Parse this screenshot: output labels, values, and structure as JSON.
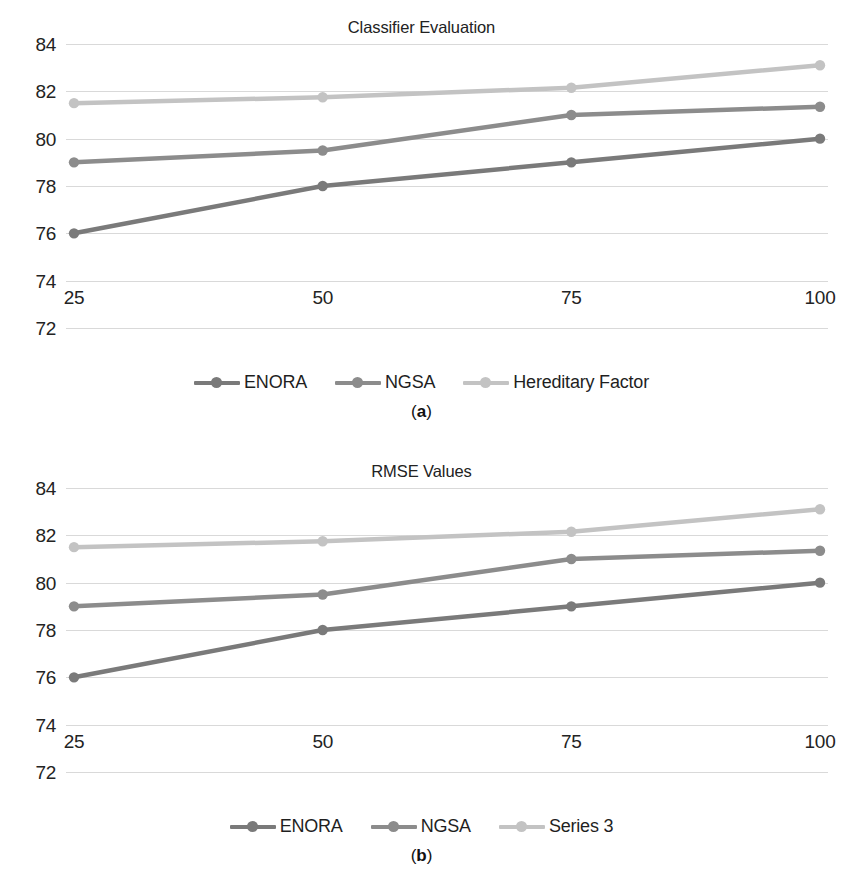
{
  "figure": {
    "panels": [
      {
        "key": "panel_a",
        "title": "Classifier Evaluation",
        "caption_open": "(",
        "caption_letter": "a",
        "caption_close": ")",
        "legend": [
          {
            "label": "ENORA",
            "color": "#7a7a7a"
          },
          {
            "label": "NGSA",
            "color": "#8c8c8c"
          },
          {
            "label": "Hereditary Factor",
            "color": "#c3c3c3"
          }
        ]
      },
      {
        "key": "panel_b",
        "title": "RMSE Values",
        "caption_open": "(",
        "caption_letter": "b",
        "caption_close": ")",
        "legend": [
          {
            "label": "ENORA",
            "color": "#7a7a7a"
          },
          {
            "label": "NGSA",
            "color": "#8c8c8c"
          },
          {
            "label": "Series 3",
            "color": "#c3c3c3"
          }
        ]
      }
    ]
  },
  "chart_data": [
    {
      "type": "line",
      "title": "Classifier Evaluation",
      "xlabel": "",
      "ylabel": "",
      "categories": [
        "25",
        "50",
        "75",
        "100"
      ],
      "x": [
        25,
        50,
        75,
        100
      ],
      "ylim": [
        72,
        84
      ],
      "yticks": [
        84,
        82,
        80,
        78,
        76,
        74,
        72
      ],
      "xticks": [
        "25",
        "50",
        "75",
        "100"
      ],
      "grid": true,
      "legend_position": "bottom",
      "markers": "circle",
      "series": [
        {
          "name": "ENORA",
          "color": "#7a7a7a",
          "values": [
            76.0,
            78.0,
            79.0,
            80.0
          ]
        },
        {
          "name": "NGSA",
          "color": "#8c8c8c",
          "values": [
            79.0,
            79.5,
            81.0,
            81.35
          ]
        },
        {
          "name": "Hereditary Factor",
          "color": "#c3c3c3",
          "values": [
            81.5,
            81.75,
            82.15,
            83.1
          ]
        }
      ]
    },
    {
      "type": "line",
      "title": "RMSE Values",
      "xlabel": "",
      "ylabel": "",
      "categories": [
        "25",
        "50",
        "75",
        "100"
      ],
      "x": [
        25,
        50,
        75,
        100
      ],
      "ylim": [
        72,
        84
      ],
      "yticks": [
        84,
        82,
        80,
        78,
        76,
        74,
        72
      ],
      "xticks": [
        "25",
        "50",
        "75",
        "100"
      ],
      "grid": true,
      "legend_position": "bottom",
      "markers": "circle",
      "series": [
        {
          "name": "ENORA",
          "color": "#7a7a7a",
          "values": [
            76.0,
            78.0,
            79.0,
            80.0
          ]
        },
        {
          "name": "NGSA",
          "color": "#8c8c8c",
          "values": [
            79.0,
            79.5,
            81.0,
            81.35
          ]
        },
        {
          "name": "Series 3",
          "color": "#c3c3c3",
          "values": [
            81.5,
            81.75,
            82.15,
            83.1
          ]
        }
      ]
    }
  ]
}
